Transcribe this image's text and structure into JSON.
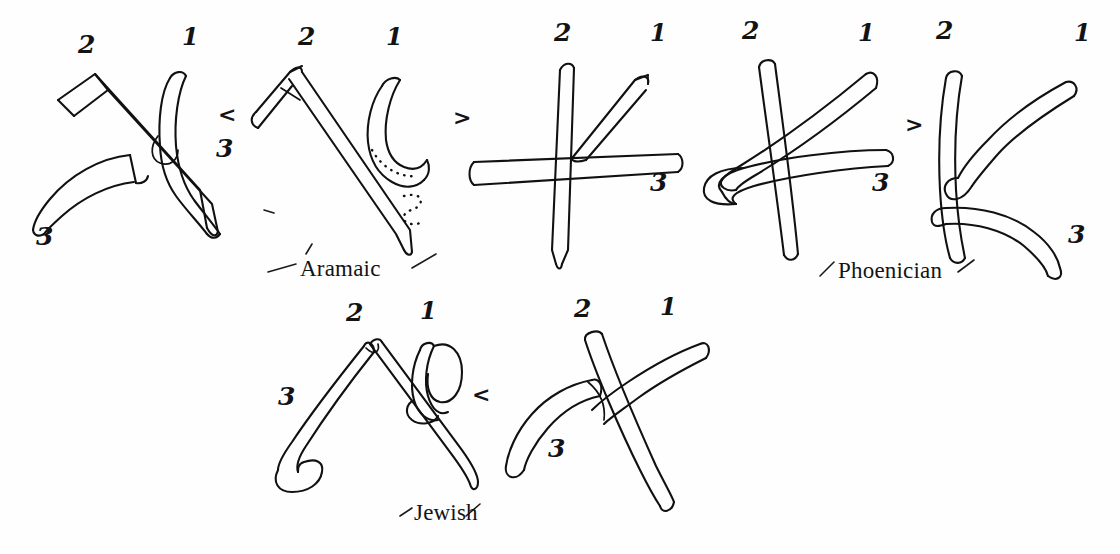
{
  "figure": {
    "background_color": "#fefefe",
    "ink_color": "#111111",
    "medium": "hand-drawn pen and ink diagram"
  },
  "script_labels": [
    {
      "id": "aramaic",
      "text": "Aramaic"
    },
    {
      "id": "phoenician",
      "text": "Phoenician"
    },
    {
      "id": "jewish",
      "text": "Jewish"
    }
  ],
  "comparison_arrows": [
    {
      "id": "arrow-row1-a",
      "text": "<"
    },
    {
      "id": "arrow-row1-b",
      "text": ">"
    },
    {
      "id": "arrow-row1-c",
      "text": ">"
    },
    {
      "id": "arrow-row2-a",
      "text": "<"
    }
  ],
  "stroke_numbers": {
    "one": "1",
    "two": "2",
    "three": "3"
  },
  "glyphs": [
    {
      "id": "glyph-1",
      "row": "top",
      "position": 1,
      "script": "Aramaic",
      "stroke_count": 3,
      "stroke_labels": [
        {
          "number": "2",
          "x": 84,
          "y": 44,
          "style": "solid"
        },
        {
          "number": "1",
          "x": 186,
          "y": 34,
          "style": "solid"
        },
        {
          "number": "3",
          "x": 40,
          "y": 230,
          "style": "solid"
        }
      ]
    },
    {
      "id": "glyph-2",
      "row": "top",
      "position": 2,
      "script": "Aramaic",
      "stroke_count": 3,
      "stroke_labels": [
        {
          "number": "2",
          "x": 304,
          "y": 34,
          "style": "solid"
        },
        {
          "number": "1",
          "x": 392,
          "y": 33,
          "style": "solid"
        },
        {
          "number": "3",
          "x": 415,
          "y": 180,
          "style": "dotted"
        }
      ]
    },
    {
      "id": "glyph-3",
      "row": "top",
      "position": 3,
      "script": "",
      "stroke_count": 3,
      "stroke_labels": [
        {
          "number": "2",
          "x": 561,
          "y": 30,
          "style": "solid"
        },
        {
          "number": "1",
          "x": 655,
          "y": 30,
          "style": "solid"
        },
        {
          "number": "3",
          "x": 657,
          "y": 177,
          "style": "solid"
        }
      ]
    },
    {
      "id": "glyph-4",
      "row": "top",
      "position": 4,
      "script": "Phoenician",
      "stroke_count": 3,
      "stroke_labels": [
        {
          "number": "2",
          "x": 748,
          "y": 28,
          "style": "solid"
        },
        {
          "number": "1",
          "x": 862,
          "y": 30,
          "style": "solid"
        },
        {
          "number": "3",
          "x": 878,
          "y": 178,
          "style": "solid"
        }
      ]
    },
    {
      "id": "glyph-5",
      "row": "top",
      "position": 5,
      "script": "Phoenician",
      "stroke_count": 3,
      "stroke_labels": [
        {
          "number": "2",
          "x": 942,
          "y": 27,
          "style": "solid"
        },
        {
          "number": "1",
          "x": 1078,
          "y": 30,
          "style": "solid"
        },
        {
          "number": "3",
          "x": 1072,
          "y": 228,
          "style": "solid"
        }
      ]
    },
    {
      "id": "glyph-6",
      "row": "bottom",
      "position": 1,
      "script": "Jewish",
      "stroke_count": 3,
      "stroke_labels": [
        {
          "number": "2",
          "x": 352,
          "y": 310,
          "style": "solid"
        },
        {
          "number": "1",
          "x": 424,
          "y": 308,
          "style": "solid"
        },
        {
          "number": "3",
          "x": 283,
          "y": 392,
          "style": "solid"
        }
      ]
    },
    {
      "id": "glyph-7",
      "row": "bottom",
      "position": 2,
      "script": "Jewish",
      "stroke_count": 3,
      "stroke_labels": [
        {
          "number": "2",
          "x": 580,
          "y": 306,
          "style": "solid"
        },
        {
          "number": "1",
          "x": 665,
          "y": 304,
          "style": "solid"
        },
        {
          "number": "3",
          "x": 552,
          "y": 443,
          "style": "solid"
        }
      ]
    }
  ],
  "extra_marks": [
    {
      "id": "stray-tick-left-of-aramaic",
      "description": "small pen tick"
    },
    {
      "id": "caret-above-aramaic-label",
      "description": "short slanted tick"
    }
  ]
}
